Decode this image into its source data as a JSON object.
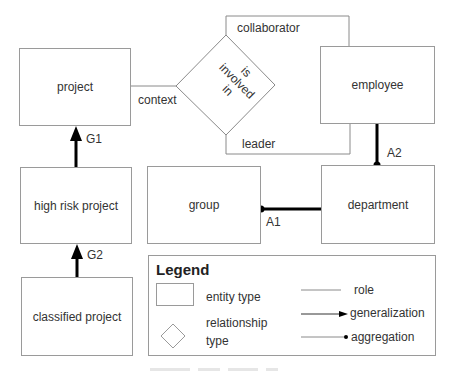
{
  "entities": {
    "project": "project",
    "high_risk_project": "high risk project",
    "classified_project": "classified project",
    "employee": "employee",
    "group": "group",
    "department": "department"
  },
  "relationship": {
    "name": "is involved in",
    "line1": "is",
    "line2": "involved",
    "line3": "in"
  },
  "roles": {
    "context": "context",
    "collaborator": "collaborator",
    "leader": "leader"
  },
  "generalizations": {
    "g1": "G1",
    "g2": "G2"
  },
  "aggregations": {
    "a1": "A1",
    "a2": "A2"
  },
  "legend": {
    "title": "Legend",
    "entity_type": "entity type",
    "relationship_line1": "relationship",
    "relationship_line2": "type",
    "role": "role",
    "generalization": "generalization",
    "aggregation": "aggregation"
  },
  "colors": {
    "box_border": "#9a9a9a",
    "thin_line": "#8a8a8a",
    "thick_line": "#000000"
  }
}
